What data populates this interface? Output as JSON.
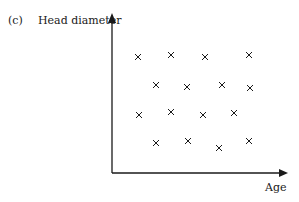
{
  "panel_label": "(c)",
  "chart_data": {
    "type": "scatter",
    "title": "",
    "xlabel": "Age",
    "ylabel": "Head diameter",
    "grid": false,
    "legend": null,
    "axis_ticks": false,
    "marker": "x",
    "points_px": [
      {
        "x": 138,
        "y": 57
      },
      {
        "x": 171,
        "y": 55
      },
      {
        "x": 205,
        "y": 57
      },
      {
        "x": 249,
        "y": 55
      },
      {
        "x": 156,
        "y": 85
      },
      {
        "x": 187,
        "y": 87
      },
      {
        "x": 222,
        "y": 85
      },
      {
        "x": 250,
        "y": 88
      },
      {
        "x": 139,
        "y": 115
      },
      {
        "x": 171,
        "y": 112
      },
      {
        "x": 203,
        "y": 115
      },
      {
        "x": 234,
        "y": 113
      },
      {
        "x": 156,
        "y": 143
      },
      {
        "x": 188,
        "y": 141
      },
      {
        "x": 219,
        "y": 148
      },
      {
        "x": 249,
        "y": 141
      }
    ]
  },
  "colors": {
    "ink": "#1a1a1a",
    "background": "#ffffff"
  }
}
